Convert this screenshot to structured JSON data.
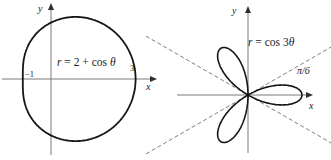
{
  "colors": {
    "background": "#ffffff",
    "curve": "#161616",
    "axis": "#7a7a7a",
    "dashed_guide": "#6f6f6f",
    "text": "#1c1c1c"
  },
  "chart_data": [
    {
      "type": "line",
      "coordinate_system": "polar",
      "equation_text": "r = 2 + cos θ",
      "equation": {
        "var": "r",
        "mid": " = 2 + ",
        "func": "cos ",
        "arg": "θ"
      },
      "polar_params": {
        "a": 2,
        "b": 1,
        "k": 1
      },
      "theta_range_rad": [
        0,
        6.28319
      ],
      "xlabel": "x",
      "ylabel": "y",
      "x_intercept_labels": [
        {
          "text": "−1",
          "value": -1
        },
        {
          "text": "3",
          "value": 3
        }
      ],
      "key_points": {
        "r_at_theta_0": 3,
        "r_at_theta_pi": 1,
        "max_y": 2.2,
        "min_y": -2.2
      },
      "grid": false,
      "legend": false
    },
    {
      "type": "line",
      "coordinate_system": "polar",
      "equation_text": "r = cos 3θ",
      "equation": {
        "var": "r",
        "mid": " = ",
        "func": "cos 3",
        "arg": "θ"
      },
      "polar_params": {
        "a": 0,
        "b": 1,
        "k": 3
      },
      "theta_range_rad": [
        0,
        3.14159
      ],
      "xlabel": "x",
      "ylabel": "y",
      "petal_count": 3,
      "petal_length": 1,
      "petal_angles_deg": [
        0,
        120,
        240
      ],
      "dashed_guide_angles_deg": [
        30,
        -30
      ],
      "angle_annotation": {
        "text": "π/6",
        "value_rad": 0.5236
      },
      "grid": false,
      "legend": false
    }
  ]
}
